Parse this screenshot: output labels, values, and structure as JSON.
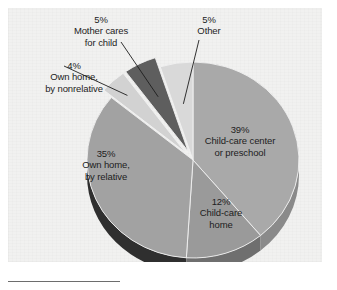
{
  "figure": {
    "background_color": "#ffffff",
    "panel_color": "#f1f1f0"
  },
  "footnote_rule": {
    "name": "footnote-separator",
    "color": "#6d6d6d"
  },
  "chart_data": {
    "type": "pie",
    "title": "",
    "subtitle": "",
    "xlabel": "",
    "ylabel": "",
    "legend_position": "none",
    "grid": false,
    "three_d": true,
    "start_angle_deg": 0,
    "direction": "clockwise",
    "units": "percent",
    "total": 100,
    "categories": [
      "Child-care center or preschool",
      "Child-care home",
      "Own home, by relative",
      "Own home, by nonrelative",
      "Mother cares for child",
      "Other"
    ],
    "values": [
      39,
      12,
      35,
      4,
      5,
      5
    ],
    "slices": [
      {
        "id": "center-or-preschool",
        "percent_text": "39%",
        "name_line_1": "Child-care center",
        "name_line_2": "or preschool",
        "value": 39,
        "color": "#a9a9a9",
        "side_color": "#8a8a8a",
        "exploded": false,
        "label_placement": "inside"
      },
      {
        "id": "child-care-home",
        "percent_text": "12%",
        "name_line_1": "Child-care",
        "name_line_2": "home",
        "value": 12,
        "color": "#9a9a9a",
        "side_color": "#6f6f6f",
        "exploded": false,
        "label_placement": "inside"
      },
      {
        "id": "own-home-by-relative",
        "percent_text": "35%",
        "name_line_1": "Own home,",
        "name_line_2": "by relative",
        "value": 35,
        "color": "#a2a2a2",
        "side_color": "#2f2f2f",
        "exploded": false,
        "label_placement": "inside"
      },
      {
        "id": "own-home-by-nonrelative",
        "percent_text": "4%",
        "name_line_1": "Own home,",
        "name_line_2": "by nonrelative",
        "value": 4,
        "color": "#d2d2d2",
        "side_color": "#aeaeae",
        "exploded": true,
        "label_placement": "outside-left",
        "leader_line": true
      },
      {
        "id": "mother-cares-for-child",
        "percent_text": "5%",
        "name_line_1": "Mother cares",
        "name_line_2": "for child",
        "value": 5,
        "color": "#5e5e5e",
        "side_color": "#3d3d3d",
        "exploded": true,
        "label_placement": "outside-top",
        "leader_line": true
      },
      {
        "id": "other",
        "percent_text": "5%",
        "name_line_1": "Other",
        "name_line_2": "",
        "value": 5,
        "color": "#d9d9d9",
        "side_color": "#b4b4b4",
        "exploded": false,
        "label_placement": "outside-top",
        "leader_line": true
      }
    ]
  }
}
